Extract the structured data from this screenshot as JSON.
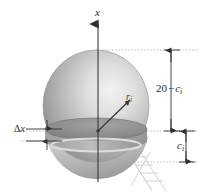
{
  "figure": {
    "background_color": "#ffffff"
  },
  "axis": {
    "name": "vertical-x-axis",
    "label": "x",
    "line_color": "#3a3a3a",
    "arrow_direction": "up",
    "x_position": 98,
    "top": 22,
    "bottom": 182
  },
  "sphere": {
    "name": "sphere-body",
    "center_x": 96,
    "center_y": 106,
    "radius_x": 53,
    "radius_y": 56,
    "fill_light": "#e8e8e6",
    "fill_mid": "#b9b9b7",
    "fill_dark": "#8f8f8d",
    "outline_color": "#9a9a98"
  },
  "slab": {
    "name": "horizontal-slab-disk",
    "top_y": 129,
    "bottom_y": 140,
    "ellipse_rx": 51,
    "ellipse_ry": 11,
    "top_fill": "#8d8d8b",
    "side_fill": "#a8a8a6",
    "rim_fill": "#d6d6d4"
  },
  "radius_vector": {
    "name": "radius-vector-ri",
    "label": "r",
    "subscript": "i",
    "from_x": 98,
    "from_y": 131,
    "to_x": 130,
    "to_y": 99,
    "color": "#3a3a3a"
  },
  "dimensions": {
    "delta_x": {
      "name": "delta-x-dimension",
      "label": "Δ",
      "label_var": "x",
      "top_y": 129,
      "bottom_y": 141,
      "arrow_x": 47,
      "extension_left": 26,
      "extension_right": 62
    },
    "upper": {
      "name": "upper-dimension",
      "value": "20",
      "operator": "−",
      "variable": "c",
      "subscript": "i",
      "line_x": 171,
      "top_y": 50,
      "bottom_y": 131
    },
    "lower": {
      "name": "lower-dimension",
      "variable": "c",
      "subscript": "i",
      "line_x": 186,
      "top_y": 131,
      "bottom_y": 162
    },
    "leader_lines": {
      "name": "dotted-leader-lines",
      "color": "#b0b0ae",
      "top_y": 50,
      "middle_y": 131,
      "bottom_y": 162,
      "left_x": 96,
      "right_x": 198
    }
  },
  "support": {
    "name": "lattice-support-structure",
    "color": "#cfcfcd",
    "top_x": 128,
    "top_y": 152,
    "bottom_x": 162,
    "bottom_y": 190
  }
}
